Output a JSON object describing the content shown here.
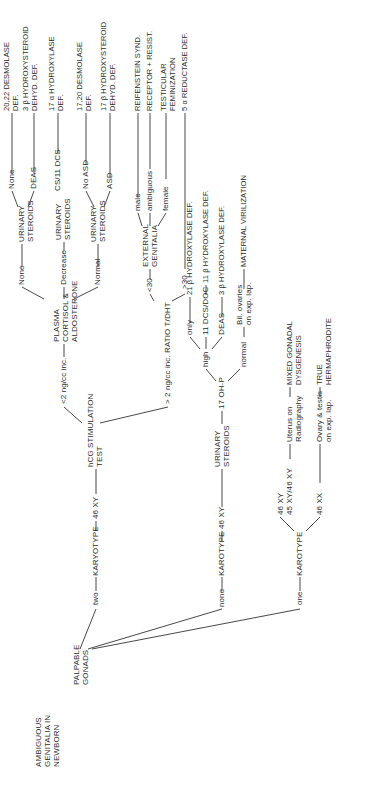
{
  "root": {
    "label": "AMBIGUOUS\nGENITALIA IN\nNEWBORN"
  },
  "palpable_gonads": {
    "label": "PALPABLE\nGONADS"
  },
  "branches": {
    "two": {
      "label": "two",
      "karyotype": "KARYOTYPE",
      "karyotype_value": "46 XY",
      "test": "hCG STIMULATION\nTEST",
      "low": {
        "label": "<2 ng/cc inc.",
        "node": "PLASMA\nCORTISOL &\nALDOSTERONE",
        "none": {
          "label": "None",
          "node": "URINARY\nSTEROIDS",
          "a_label": "None",
          "a_result": "20,22 DESMOLASE\nDEF.",
          "b_label": "DEAS",
          "b_result": "3 β HYDROXYSTEROID\nDEHYD. DEF."
        },
        "decrease": {
          "label": "Decrease",
          "node": "URINARY\nSTEROIDS",
          "a_label": "CS/11 DCS",
          "a_result": "17 α HYDROXYLASE\nDEF."
        },
        "normal": {
          "label": "Normal",
          "node": "URINARY\nSTEROIDS",
          "a_label": "No ASD",
          "a_result": "17,20 DESMOLASE\nDEF.",
          "b_label": "ASD",
          "b_result": "17 β HYDROXYSTEROID\nDEHYD. DEF."
        }
      },
      "high": {
        "label": "> 2 ng/cc inc. RATIO T/DHT",
        "lt30": {
          "label": "<30",
          "node": "EXTERNAL\nGENITALIA",
          "male": {
            "label": "male",
            "result": "REIFENSTEIN SYND."
          },
          "ambiguous": {
            "label": "ambiguous",
            "result": "RECEPTOR + RESIST."
          },
          "female": {
            "label": "female",
            "result": "TESTICULAR\nFEMINIZATION"
          }
        },
        "gt30": {
          "label": ">30",
          "result": "5 α REDUCTASE DEF."
        }
      }
    },
    "none": {
      "label": "none",
      "karyotype": "KAROTYPE",
      "karyotype_value": "46 XY",
      "node": "URINARY\nSTEROIDS",
      "test": "17 OH-P",
      "high": {
        "label": "high",
        "only": {
          "label": "only",
          "result": "21 β HYDROXYLASE DEF."
        },
        "dcs": {
          "label": "11 DCS/DOC",
          "result": "11 β HYDROXYLASE DEF."
        },
        "deas": {
          "label": "DEAS",
          "result": "3 β HYDROXYLASE DEF."
        }
      },
      "normal": {
        "label": "normal",
        "node": "Bil. ovaries\non exp. lap.",
        "result": "MATERNAL VIRILIZATION"
      }
    },
    "one": {
      "label": "one",
      "karyotype": "KAROTYPE",
      "xy": {
        "label": "46 XY\n45 XY/46 XY",
        "node": "Uterus on\nRadiography",
        "result": "MIXED GONADAL\nDYSGENESIS"
      },
      "xx": {
        "label": "46 XX",
        "node": "Ovary & testis\non exp. lap.",
        "result": "TRUE\nHERMAPHRODITE"
      }
    }
  }
}
